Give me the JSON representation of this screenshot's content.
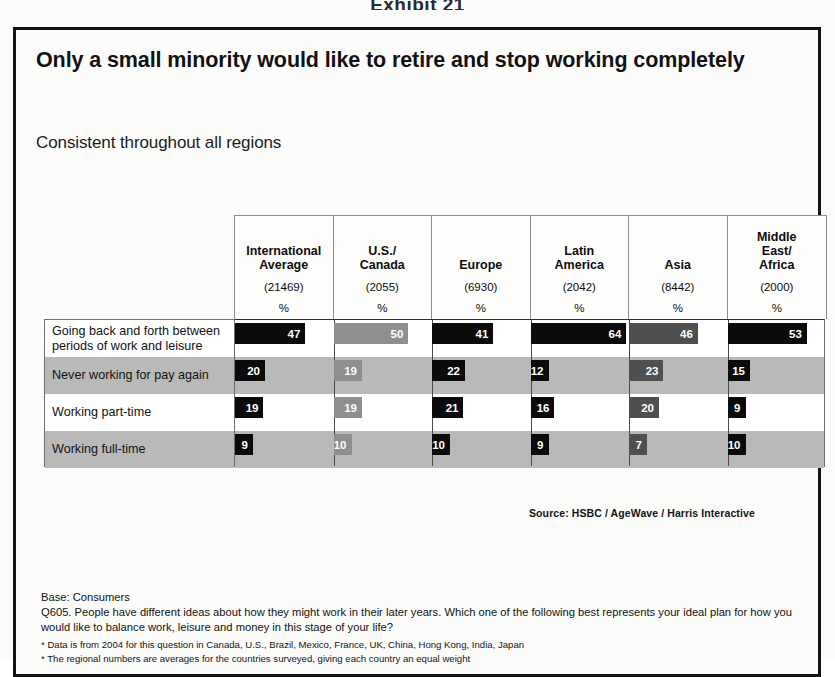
{
  "exhibit_caption": "Exhibit 21",
  "title": "Only a small minority would like to retire and stop working completely",
  "subtitle": "Consistent throughout all regions",
  "source": "Source:  HSBC / AgeWave / Harris Interactive",
  "footnotes": {
    "base": "Base: Consumers",
    "question": "Q605. People have different ideas about how they might work in their later years. Which one of the following best represents your ideal plan for how you would like to balance work, leisure and money in this stage of your life?",
    "note1": "* Data is from 2004 for this question in Canada, U.S., Brazil, Mexico, France, UK, China, Hong Kong, India, Japan",
    "note2": "* The regional numbers are averages for the countries surveyed, giving each country an equal weight"
  },
  "column_meta": {
    "base_label_prefix": "(",
    "base_label_suffix": ")",
    "unit": "%"
  },
  "chart_data": {
    "type": "bar",
    "title": "Only a small minority would like to retire and stop working completely",
    "subtitle": "Consistent throughout all regions",
    "xlabel": "",
    "ylabel": "",
    "xlim": [
      0,
      100
    ],
    "grid": false,
    "legend": "none",
    "orientation": "horizontal",
    "value_unit": "%",
    "categories": [
      "Going back and forth between periods of work and leisure",
      "Never working for pay again",
      "Working part-time",
      "Working full-time"
    ],
    "columns": [
      {
        "name": "International\nAverage",
        "base": "21469",
        "unit": "%",
        "shade": "dark"
      },
      {
        "name": "U.S./\nCanada",
        "base": "2055",
        "unit": "%",
        "shade": "light"
      },
      {
        "name": "Europe",
        "base": "6930",
        "unit": "%",
        "shade": "dark"
      },
      {
        "name": "Latin\nAmerica",
        "base": "2042",
        "unit": "%",
        "shade": "dark"
      },
      {
        "name": "Asia",
        "base": "8442",
        "unit": "%",
        "shade": "medium"
      },
      {
        "name": "Middle\nEast/\nAfrica",
        "base": "2000",
        "unit": "%",
        "shade": "dark"
      }
    ],
    "series": [
      {
        "name": "International Average",
        "values": [
          47,
          20,
          19,
          9
        ]
      },
      {
        "name": "U.S./Canada",
        "values": [
          50,
          19,
          19,
          10
        ]
      },
      {
        "name": "Europe",
        "values": [
          41,
          22,
          21,
          10
        ]
      },
      {
        "name": "Latin America",
        "values": [
          64,
          12,
          16,
          9
        ]
      },
      {
        "name": "Asia",
        "values": [
          46,
          23,
          20,
          7
        ]
      },
      {
        "name": "Middle East/Africa",
        "values": [
          53,
          15,
          9,
          10
        ]
      }
    ]
  },
  "colors": {
    "bar_dark": "#0b0b0b",
    "bar_medium": "#4f4f4f",
    "bar_light": "#8e8e8e",
    "band": "#b9b9b9",
    "frame": "#141414"
  }
}
